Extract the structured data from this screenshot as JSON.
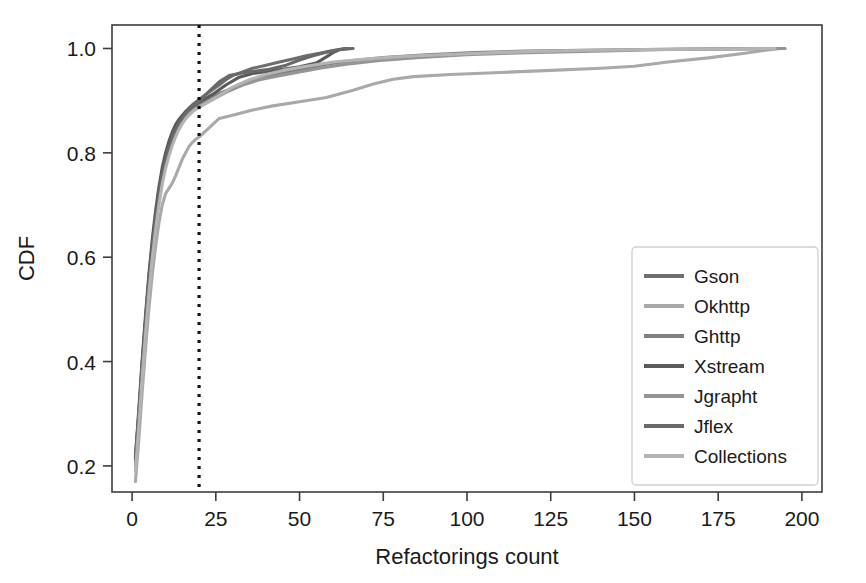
{
  "chart_data": {
    "type": "line",
    "title": "",
    "subtitle": "",
    "xlabel": "Refactorings count",
    "ylabel": "CDF",
    "xlim": [
      -6,
      206
    ],
    "ylim": [
      0.15,
      1.045
    ],
    "xticks": [
      0,
      25,
      50,
      75,
      100,
      125,
      150,
      175,
      200
    ],
    "xticklabels": [
      "0",
      "25",
      "50",
      "75",
      "100",
      "125",
      "150",
      "175",
      "200"
    ],
    "yticks": [
      0.2,
      0.4,
      0.6,
      0.8,
      1.0
    ],
    "yticklabels": [
      "0.2",
      "0.4",
      "0.6",
      "0.8",
      "1.0"
    ],
    "grid": false,
    "legend_position": "lower right",
    "annotations": [
      {
        "name": "threshold-vline",
        "type": "vline",
        "x": 20,
        "style": "dotted",
        "color": "#111111"
      }
    ],
    "series": [
      {
        "name": "Gson",
        "color": "#6e6e6e",
        "points": [
          [
            1,
            0.215
          ],
          [
            2,
            0.3
          ],
          [
            3,
            0.395
          ],
          [
            4,
            0.48
          ],
          [
            5,
            0.56
          ],
          [
            6,
            0.625
          ],
          [
            7,
            0.68
          ],
          [
            8,
            0.725
          ],
          [
            9,
            0.762
          ],
          [
            10,
            0.79
          ],
          [
            11,
            0.812
          ],
          [
            12,
            0.832
          ],
          [
            13,
            0.848
          ],
          [
            14,
            0.86
          ],
          [
            15,
            0.87
          ],
          [
            16,
            0.879
          ],
          [
            17,
            0.886
          ],
          [
            18,
            0.892
          ],
          [
            19,
            0.897
          ],
          [
            20,
            0.902
          ],
          [
            22,
            0.912
          ],
          [
            24,
            0.921
          ],
          [
            26,
            0.93
          ],
          [
            28,
            0.94
          ],
          [
            30,
            0.948
          ],
          [
            33,
            0.955
          ],
          [
            36,
            0.962
          ],
          [
            40,
            0.968
          ],
          [
            44,
            0.974
          ],
          [
            48,
            0.98
          ],
          [
            52,
            0.986
          ],
          [
            56,
            0.991
          ],
          [
            60,
            0.996
          ],
          [
            63,
            0.999
          ],
          [
            65,
            1.0
          ]
        ]
      },
      {
        "name": "Okhttp",
        "color": "#a9a9a9",
        "points": [
          [
            1,
            0.17
          ],
          [
            2,
            0.25
          ],
          [
            3,
            0.34
          ],
          [
            4,
            0.425
          ],
          [
            5,
            0.5
          ],
          [
            6,
            0.565
          ],
          [
            7,
            0.62
          ],
          [
            8,
            0.665
          ],
          [
            9,
            0.7
          ],
          [
            10,
            0.722
          ],
          [
            11,
            0.732
          ],
          [
            12,
            0.742
          ],
          [
            13,
            0.756
          ],
          [
            14,
            0.772
          ],
          [
            15,
            0.788
          ],
          [
            16,
            0.8
          ],
          [
            17,
            0.812
          ],
          [
            18,
            0.82
          ],
          [
            19,
            0.826
          ],
          [
            20,
            0.83
          ],
          [
            23,
            0.848
          ],
          [
            26,
            0.866
          ],
          [
            30,
            0.872
          ],
          [
            36,
            0.882
          ],
          [
            42,
            0.89
          ],
          [
            50,
            0.898
          ],
          [
            58,
            0.906
          ],
          [
            66,
            0.92
          ],
          [
            72,
            0.932
          ],
          [
            78,
            0.941
          ],
          [
            84,
            0.946
          ],
          [
            95,
            0.95
          ],
          [
            110,
            0.954
          ],
          [
            125,
            0.958
          ],
          [
            140,
            0.962
          ],
          [
            150,
            0.966
          ],
          [
            160,
            0.974
          ],
          [
            172,
            0.982
          ],
          [
            183,
            0.991
          ],
          [
            193,
            1.0
          ]
        ]
      },
      {
        "name": "Ghttp",
        "color": "#808080",
        "points": [
          [
            1,
            0.205
          ],
          [
            2,
            0.292
          ],
          [
            3,
            0.385
          ],
          [
            4,
            0.47
          ],
          [
            5,
            0.548
          ],
          [
            6,
            0.612
          ],
          [
            7,
            0.668
          ],
          [
            8,
            0.714
          ],
          [
            9,
            0.752
          ],
          [
            10,
            0.782
          ],
          [
            11,
            0.806
          ],
          [
            12,
            0.826
          ],
          [
            13,
            0.843
          ],
          [
            14,
            0.856
          ],
          [
            15,
            0.866
          ],
          [
            16,
            0.874
          ],
          [
            17,
            0.88
          ],
          [
            18,
            0.886
          ],
          [
            19,
            0.89
          ],
          [
            20,
            0.894
          ],
          [
            23,
            0.904
          ],
          [
            26,
            0.914
          ],
          [
            30,
            0.924
          ],
          [
            35,
            0.936
          ],
          [
            40,
            0.946
          ],
          [
            46,
            0.954
          ],
          [
            52,
            0.962
          ],
          [
            58,
            0.97
          ],
          [
            66,
            0.977
          ],
          [
            76,
            0.983
          ],
          [
            88,
            0.988
          ],
          [
            102,
            0.992
          ],
          [
            118,
            0.995
          ],
          [
            140,
            0.997
          ],
          [
            165,
            0.999
          ],
          [
            194,
            1.0
          ]
        ]
      },
      {
        "name": "Xstream",
        "color": "#5a5a5a",
        "points": [
          [
            1,
            0.218
          ],
          [
            2,
            0.308
          ],
          [
            3,
            0.402
          ],
          [
            4,
            0.488
          ],
          [
            5,
            0.566
          ],
          [
            6,
            0.632
          ],
          [
            7,
            0.688
          ],
          [
            8,
            0.734
          ],
          [
            9,
            0.772
          ],
          [
            10,
            0.8
          ],
          [
            11,
            0.822
          ],
          [
            12,
            0.84
          ],
          [
            13,
            0.854
          ],
          [
            14,
            0.864
          ],
          [
            15,
            0.872
          ],
          [
            16,
            0.879
          ],
          [
            17,
            0.884
          ],
          [
            18,
            0.889
          ],
          [
            19,
            0.893
          ],
          [
            20,
            0.897
          ],
          [
            24,
            0.912
          ],
          [
            28,
            0.93
          ],
          [
            32,
            0.945
          ],
          [
            36,
            0.952
          ],
          [
            40,
            0.956
          ],
          [
            45,
            0.96
          ],
          [
            50,
            0.965
          ],
          [
            55,
            0.972
          ],
          [
            58,
            0.984
          ],
          [
            60,
            0.992
          ],
          [
            62,
            0.998
          ],
          [
            64,
            1.0
          ]
        ]
      },
      {
        "name": "Jgrapht",
        "color": "#959595",
        "points": [
          [
            1,
            0.2
          ],
          [
            2,
            0.286
          ],
          [
            3,
            0.378
          ],
          [
            4,
            0.462
          ],
          [
            5,
            0.54
          ],
          [
            6,
            0.606
          ],
          [
            7,
            0.662
          ],
          [
            8,
            0.708
          ],
          [
            9,
            0.746
          ],
          [
            10,
            0.776
          ],
          [
            11,
            0.8
          ],
          [
            12,
            0.82
          ],
          [
            13,
            0.836
          ],
          [
            14,
            0.85
          ],
          [
            15,
            0.86
          ],
          [
            16,
            0.868
          ],
          [
            17,
            0.875
          ],
          [
            18,
            0.88
          ],
          [
            19,
            0.885
          ],
          [
            20,
            0.888
          ],
          [
            24,
            0.902
          ],
          [
            28,
            0.916
          ],
          [
            33,
            0.93
          ],
          [
            38,
            0.94
          ],
          [
            44,
            0.948
          ],
          [
            50,
            0.955
          ],
          [
            56,
            0.962
          ],
          [
            64,
            0.97
          ],
          [
            74,
            0.977
          ],
          [
            86,
            0.983
          ],
          [
            100,
            0.988
          ],
          [
            118,
            0.992
          ],
          [
            138,
            0.995
          ],
          [
            160,
            0.998
          ],
          [
            180,
            0.999
          ],
          [
            195,
            1.0
          ]
        ]
      },
      {
        "name": "Jflex",
        "color": "#696969",
        "points": [
          [
            1,
            0.212
          ],
          [
            2,
            0.298
          ],
          [
            3,
            0.392
          ],
          [
            4,
            0.476
          ],
          [
            5,
            0.554
          ],
          [
            6,
            0.618
          ],
          [
            7,
            0.674
          ],
          [
            8,
            0.72
          ],
          [
            9,
            0.758
          ],
          [
            10,
            0.788
          ],
          [
            11,
            0.81
          ],
          [
            12,
            0.829
          ],
          [
            13,
            0.845
          ],
          [
            14,
            0.857
          ],
          [
            15,
            0.867
          ],
          [
            16,
            0.876
          ],
          [
            17,
            0.883
          ],
          [
            18,
            0.889
          ],
          [
            19,
            0.894
          ],
          [
            20,
            0.899
          ],
          [
            23,
            0.918
          ],
          [
            26,
            0.936
          ],
          [
            29,
            0.948
          ],
          [
            32,
            0.952
          ],
          [
            36,
            0.956
          ],
          [
            41,
            0.96
          ],
          [
            46,
            0.968
          ],
          [
            50,
            0.978
          ],
          [
            54,
            0.986
          ],
          [
            58,
            0.993
          ],
          [
            62,
            0.998
          ],
          [
            66,
            1.0
          ]
        ]
      },
      {
        "name": "Collections",
        "color": "#b4b4b4",
        "points": [
          [
            1,
            0.19
          ],
          [
            2,
            0.276
          ],
          [
            3,
            0.368
          ],
          [
            4,
            0.452
          ],
          [
            5,
            0.53
          ],
          [
            6,
            0.596
          ],
          [
            7,
            0.652
          ],
          [
            8,
            0.7
          ],
          [
            9,
            0.74
          ],
          [
            10,
            0.77
          ],
          [
            11,
            0.794
          ],
          [
            12,
            0.814
          ],
          [
            13,
            0.831
          ],
          [
            14,
            0.845
          ],
          [
            15,
            0.856
          ],
          [
            16,
            0.865
          ],
          [
            17,
            0.872
          ],
          [
            18,
            0.878
          ],
          [
            19,
            0.883
          ],
          [
            20,
            0.887
          ],
          [
            25,
            0.906
          ],
          [
            30,
            0.926
          ],
          [
            35,
            0.94
          ],
          [
            40,
            0.95
          ],
          [
            45,
            0.958
          ],
          [
            52,
            0.966
          ],
          [
            60,
            0.974
          ],
          [
            70,
            0.98
          ],
          [
            82,
            0.985
          ],
          [
            96,
            0.989
          ],
          [
            112,
            0.993
          ],
          [
            132,
            0.996
          ],
          [
            155,
            0.998
          ],
          [
            175,
            0.999
          ],
          [
            192,
            1.0
          ]
        ]
      }
    ]
  },
  "legend": {
    "items": [
      {
        "label": "Gson",
        "color": "#6e6e6e"
      },
      {
        "label": "Okhttp",
        "color": "#a9a9a9"
      },
      {
        "label": "Ghttp",
        "color": "#808080"
      },
      {
        "label": "Xstream",
        "color": "#5a5a5a"
      },
      {
        "label": "Jgrapht",
        "color": "#959595"
      },
      {
        "label": "Jflex",
        "color": "#696969"
      },
      {
        "label": "Collections",
        "color": "#b4b4b4"
      }
    ]
  },
  "colors": {
    "background": "#ffffff",
    "frame": "#3c3c3c",
    "text": "#1a1a1a",
    "vline": "#111111",
    "legend_border": "#cfcfcf"
  }
}
